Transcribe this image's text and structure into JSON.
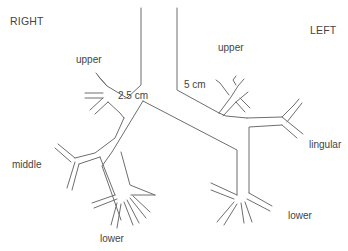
{
  "diagram": {
    "stroke_color": "#6e6e6e",
    "text_color": "#444444",
    "labels": {
      "right": "RIGHT",
      "left": "LEFT",
      "right_upper": "upper",
      "left_upper": "upper",
      "right_main_length": "2.5 cm",
      "left_main_length": "5 cm",
      "lingular": "lingular",
      "right_middle": "middle",
      "right_lower": "lower",
      "left_lower": "lower"
    },
    "label_positions": {
      "right": [
        10,
        16
      ],
      "left": [
        310,
        25
      ],
      "right_upper": [
        76,
        55
      ],
      "left_upper": [
        218,
        43
      ],
      "right_main_length": [
        118,
        91
      ],
      "left_main_length": [
        184,
        80
      ],
      "lingular": [
        309,
        140
      ],
      "right_middle": [
        12,
        160
      ],
      "right_lower": [
        100,
        234
      ],
      "left_lower": [
        288,
        211
      ]
    },
    "paths": [
      {
        "name": "trachea-right-wall",
        "d": "M141 8 L141 85 L127 98"
      },
      {
        "name": "trachea-left-wall",
        "d": "M177 8 L177 90 L219 113"
      },
      {
        "name": "carina",
        "d": "M143 101 L112 152 L102 166 L121 220"
      },
      {
        "name": "carina-left",
        "d": "M143 101 L237 150 L237 195"
      },
      {
        "name": "right-upper-stem",
        "d": "M127 98 L107 86 L100 78"
      },
      {
        "name": "right-upper-top",
        "d": "M107 86 L98 76 M100 78 L96 73"
      },
      {
        "name": "right-upper-horiz-a",
        "d": "M85 93 L103 93"
      },
      {
        "name": "right-upper-horiz-b",
        "d": "M85 98 L103 98"
      },
      {
        "name": "right-upper-lower-a",
        "d": "M90 110 L103 98"
      },
      {
        "name": "right-upper-lower-b",
        "d": "M95 114 L108 102"
      },
      {
        "name": "right-upper-low-branch",
        "d": "M108 102 L120 113 L124 118"
      },
      {
        "name": "right-intermediate-outer",
        "d": "M124 118 L115 138 L95 153 L75 158"
      },
      {
        "name": "right-middle-a",
        "d": "M75 158 L58 144"
      },
      {
        "name": "right-middle-b",
        "d": "M71 162 L55 148"
      },
      {
        "name": "right-middle-down-a",
        "d": "M75 162 L67 188"
      },
      {
        "name": "right-middle-down-b",
        "d": "M79 164 L72 190"
      },
      {
        "name": "right-middle-inner",
        "d": "M79 164 L100 157"
      },
      {
        "name": "right-lower-trunk",
        "d": "M100 157 L115 195"
      },
      {
        "name": "right-lower-inner",
        "d": "M121 152 L130 185 L155 195"
      },
      {
        "name": "right-lower-lat-a",
        "d": "M115 195 L92 203"
      },
      {
        "name": "right-lower-lat-b",
        "d": "M117 199 L94 208"
      },
      {
        "name": "right-lower-down-a",
        "d": "M117 203 L111 225"
      },
      {
        "name": "right-lower-down-b",
        "d": "M121 204 L117 228"
      },
      {
        "name": "right-lower-post-a",
        "d": "M124 202 L133 225"
      },
      {
        "name": "right-lower-post-b",
        "d": "M127 200 L139 223"
      },
      {
        "name": "right-lower-post-c",
        "d": "M130 198 L146 218"
      },
      {
        "name": "right-lower-post-d",
        "d": "M133 196 L150 212"
      },
      {
        "name": "right-lower-med",
        "d": "M155 195 L131 195"
      },
      {
        "name": "left-main-outer",
        "d": "M219 113 L226 116 L247 118"
      },
      {
        "name": "left-upper-x-a",
        "d": "M219 113 L231 97 L238 86 L244 79"
      },
      {
        "name": "left-upper-x-b",
        "d": "M223 116 L236 102 L248 92"
      },
      {
        "name": "left-upper-x-c",
        "d": "M229 95 L220 83 L216 80"
      },
      {
        "name": "left-upper-x-d",
        "d": "M236 85 L233 80 L236 76"
      },
      {
        "name": "left-upper-x-e",
        "d": "M236 102 L245 112"
      },
      {
        "name": "left-upper-x-f",
        "d": "M240 98 L250 108"
      },
      {
        "name": "left-lingular-trunk",
        "d": "M247 118 L282 117 L294 105 L299 99"
      },
      {
        "name": "left-lingular-b",
        "d": "M287 122 L302 103"
      },
      {
        "name": "left-lingular-c",
        "d": "M282 117 L298 130 L303 134"
      },
      {
        "name": "left-lingular-d",
        "d": "M282 125 L297 138"
      },
      {
        "name": "left-lower-inner-top",
        "d": "M282 125 L249 127 L249 193"
      },
      {
        "name": "left-lower-lat-a",
        "d": "M237 195 L211 183"
      },
      {
        "name": "left-lower-lat-b",
        "d": "M234 199 L211 190"
      },
      {
        "name": "left-lower-down-a",
        "d": "M234 202 L217 222"
      },
      {
        "name": "left-lower-down-b",
        "d": "M237 204 L224 225"
      },
      {
        "name": "left-lower-down-c",
        "d": "M241 203 L244 223"
      },
      {
        "name": "left-lower-down-d",
        "d": "M245 202 L252 222"
      },
      {
        "name": "left-lower-med-a",
        "d": "M249 193 L272 206"
      },
      {
        "name": "left-lower-med-b",
        "d": "M247 199 L270 211"
      }
    ]
  }
}
